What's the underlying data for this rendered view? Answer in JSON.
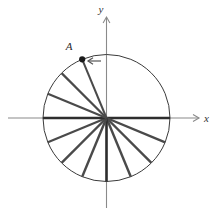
{
  "figure": {
    "width": 214,
    "height": 215,
    "background_color": "#ffffff"
  },
  "colors": {
    "circle_stroke": "#3a3a3a",
    "axis_stroke": "#8a8a8a",
    "spoke_stroke": "#4a4a4a",
    "spoke_stroke_dark": "#2e2e2e",
    "point_fill": "#1a1a1a",
    "label_color": "#333333",
    "direction_arrow": "#555555"
  },
  "geometry": {
    "center_x": 106.5,
    "center_y": 118,
    "radius": 63.5
  },
  "axes": {
    "x_label": "x",
    "y_label": "y",
    "x_axis_name": "horizontal-axis",
    "y_axis_name": "vertical-axis",
    "x_arrow_tip_x": 199,
    "y_arrow_tip_y": 17
  },
  "point": {
    "label": "A",
    "angle_deg": 112.5,
    "label_offset_x": -13,
    "label_offset_y": -9,
    "radius_px": 3.1
  },
  "direction_arrow": {
    "name": "counterclockwise-direction-arrow",
    "tip_x": 88,
    "tip_y": 61,
    "tail_x": 101,
    "tail_y": 61,
    "label": "counterclockwise"
  },
  "spokes": [
    {
      "name": "spoke-0deg",
      "angle_deg": 0,
      "weight": 2.6
    },
    {
      "name": "spoke-n22deg",
      "angle_deg": -22.5,
      "weight": 2.4
    },
    {
      "name": "spoke-n45deg",
      "angle_deg": -45,
      "weight": 2.4
    },
    {
      "name": "spoke-n67deg",
      "angle_deg": -67.5,
      "weight": 2.4
    },
    {
      "name": "spoke-n90deg",
      "angle_deg": -90,
      "weight": 2.6
    },
    {
      "name": "spoke-n112deg",
      "angle_deg": -112.5,
      "weight": 2.4
    },
    {
      "name": "spoke-n135deg",
      "angle_deg": -135,
      "weight": 2.4
    },
    {
      "name": "spoke-n157deg",
      "angle_deg": -157.5,
      "weight": 2.2
    },
    {
      "name": "spoke-180deg",
      "angle_deg": 180,
      "weight": 2.6
    },
    {
      "name": "spoke-157deg",
      "angle_deg": 157.5,
      "weight": 2.2
    },
    {
      "name": "spoke-135deg",
      "angle_deg": 135,
      "weight": 2.2
    },
    {
      "name": "spoke-112deg",
      "angle_deg": 112.5,
      "weight": 2.0
    }
  ]
}
